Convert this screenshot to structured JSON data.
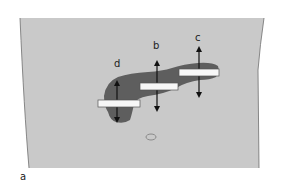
{
  "figure": {
    "panel_label": "a",
    "colors": {
      "background": "#ffffff",
      "body_panel": "#c9c9c9",
      "body_edge": "#6f6f6f",
      "organ": "#5e5e5e",
      "transducer_fill": "#f7f7f7",
      "transducer_stroke": "#555555",
      "arrow": "#111111"
    },
    "organ": "pancreas",
    "transducers": [
      {
        "id": "d",
        "label": "d"
      },
      {
        "id": "b",
        "label": "b"
      },
      {
        "id": "c",
        "label": "c"
      }
    ],
    "landmark": "umbilicus"
  }
}
